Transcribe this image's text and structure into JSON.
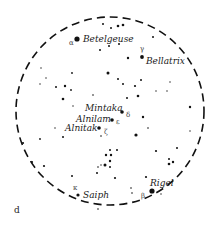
{
  "figure": {
    "panel_label": "d",
    "boundary": {
      "cx": 110,
      "cy": 111,
      "r": 94,
      "style": "dashed"
    },
    "colors": {
      "ink": "#111111",
      "background": "#ffffff",
      "greek": "#444444"
    }
  },
  "named_stars": [
    {
      "name": "Betelgeuse",
      "greek": "α",
      "x": 77,
      "y": 39,
      "r": 2.6,
      "label_x": 83,
      "label_y": 42,
      "greek_x": 69,
      "greek_y": 45
    },
    {
      "name": "Bellatrix",
      "greek": "γ",
      "x": 142,
      "y": 57,
      "r": 1.9,
      "label_x": 146,
      "label_y": 64,
      "greek_x": 140,
      "greek_y": 51
    },
    {
      "name": "Mintaka",
      "greek": "δ",
      "x": 122,
      "y": 112,
      "r": 1.8,
      "label_x": 85,
      "label_y": 111,
      "greek_x": 126,
      "greek_y": 117
    },
    {
      "name": "Alnilam",
      "greek": "ε",
      "x": 112,
      "y": 120,
      "r": 1.8,
      "label_x": 76,
      "label_y": 122,
      "greek_x": 116,
      "greek_y": 124
    },
    {
      "name": "Alnitak",
      "greek": "ζ",
      "x": 99,
      "y": 128,
      "r": 1.8,
      "label_x": 65,
      "label_y": 131,
      "greek_x": 104,
      "greek_y": 134
    },
    {
      "name": "Rigel",
      "greek": "β",
      "x": 152,
      "y": 191,
      "r": 2.6,
      "label_x": 150,
      "label_y": 186,
      "greek_x": 141,
      "greek_y": 198
    },
    {
      "name": "Saiph",
      "greek": "κ",
      "x": 78,
      "y": 195,
      "r": 1.6,
      "label_x": 83,
      "label_y": 198,
      "greek_x": 73,
      "greek_y": 190
    }
  ],
  "background_stars": [
    [
      103,
      24,
      1.0
    ],
    [
      118,
      26,
      1.3
    ],
    [
      123,
      25,
      1.3
    ],
    [
      111,
      28,
      1.0
    ],
    [
      153,
      37,
      1.0
    ],
    [
      100,
      50,
      1.0
    ],
    [
      109,
      46,
      1.0
    ],
    [
      119,
      44,
      1.0
    ],
    [
      128,
      58,
      1.2
    ],
    [
      108,
      73,
      1.5
    ],
    [
      72,
      73,
      0.9
    ],
    [
      41,
      68,
      0.7
    ],
    [
      46,
      78,
      0.7
    ],
    [
      40,
      84,
      0.7
    ],
    [
      56,
      87,
      1.0
    ],
    [
      65,
      86,
      1.2
    ],
    [
      71,
      90,
      0.9
    ],
    [
      63,
      99,
      1.3
    ],
    [
      93,
      95,
      0.8
    ],
    [
      118,
      79,
      1.0
    ],
    [
      123,
      84,
      1.0
    ],
    [
      135,
      86,
      1.1
    ],
    [
      141,
      80,
      1.0
    ],
    [
      170,
      82,
      0.7
    ],
    [
      156,
      91,
      0.7
    ],
    [
      167,
      91,
      0.7
    ],
    [
      127,
      98,
      1.0
    ],
    [
      138,
      96,
      1.3
    ],
    [
      190,
      107,
      1.2
    ],
    [
      73,
      106,
      0.7
    ],
    [
      143,
      117,
      1.2
    ],
    [
      148,
      128,
      0.8
    ],
    [
      136,
      135,
      1.6
    ],
    [
      101,
      136,
      0.8
    ],
    [
      55,
      128,
      0.7
    ],
    [
      63,
      137,
      1.0
    ],
    [
      40,
      139,
      0.9
    ],
    [
      190,
      131,
      0.7
    ],
    [
      23,
      143,
      1.1
    ],
    [
      32,
      162,
      1.1
    ],
    [
      44,
      166,
      1.1
    ],
    [
      110,
      150,
      1.0
    ],
    [
      117,
      150,
      1.0
    ],
    [
      106,
      155,
      1.2
    ],
    [
      111,
      155,
      1.2
    ],
    [
      110,
      161,
      1.2
    ],
    [
      110,
      167,
      1.0
    ],
    [
      105,
      165,
      1.5
    ],
    [
      98,
      167,
      0.8
    ],
    [
      101,
      165,
      0.7
    ],
    [
      97,
      173,
      1.0
    ],
    [
      115,
      178,
      1.1
    ],
    [
      156,
      151,
      1.1
    ],
    [
      177,
      148,
      1.0
    ],
    [
      169,
      159,
      1.0
    ],
    [
      173,
      162,
      1.2
    ],
    [
      169,
      164,
      1.3
    ],
    [
      146,
      177,
      1.1
    ],
    [
      131,
      188,
      0.8
    ],
    [
      132,
      193,
      0.8
    ],
    [
      72,
      176,
      1.0
    ],
    [
      98,
      209,
      0.8
    ],
    [
      161,
      194,
      0.7
    ]
  ]
}
